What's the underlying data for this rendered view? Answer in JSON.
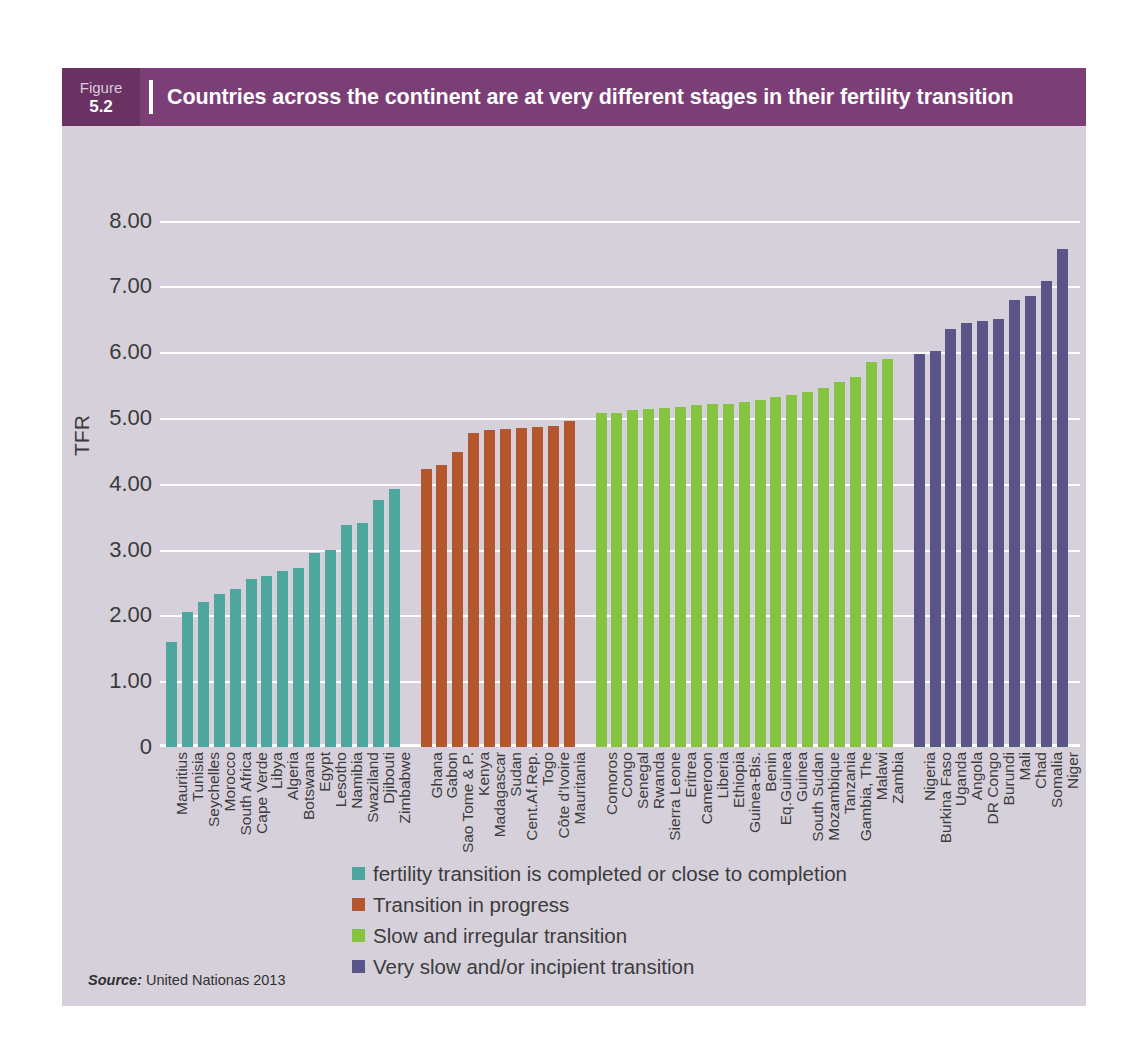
{
  "figure": {
    "tag_word": "Figure",
    "tag_number": "5.2",
    "title": "Countries across the continent are at very different stages in their fertility transition",
    "source_label": "Source:",
    "source_text": "United Nationas 2013"
  },
  "colors": {
    "title_bar": "#7c3e77",
    "title_tag": "#693263",
    "panel": "#d5d0da",
    "gridline": "#ffffff",
    "teal": "#4da79f",
    "orange": "#b4572f",
    "green": "#85c341",
    "purple": "#5a5588"
  },
  "legend": {
    "items": [
      {
        "color": "#4da79f",
        "label": "fertility transition is completed or close to completion"
      },
      {
        "color": "#b4572f",
        "label": "Transition in progress"
      },
      {
        "color": "#85c341",
        "label": "Slow and irregular transition"
      },
      {
        "color": "#5a5588",
        "label": "Very slow and/or incipient transition"
      }
    ]
  },
  "chart_data": {
    "type": "bar",
    "title": "Countries across the continent are at very different stages in their fertility transition",
    "xlabel": "",
    "ylabel": "TFR",
    "ylim": [
      0,
      8
    ],
    "yticks": [
      "0",
      "1.00",
      "2.00",
      "3.00",
      "4.00",
      "5.00",
      "6.00",
      "7.00",
      "8.00"
    ],
    "ytick_values": [
      0,
      1,
      2,
      3,
      4,
      5,
      6,
      7,
      8
    ],
    "grid": true,
    "legend_position": "bottom",
    "groups": [
      {
        "name": "fertility transition is completed or close to completion",
        "color": "#4da79f",
        "categories": [
          "Mauritius",
          "Tunisia",
          "Seychelles",
          "Morocco",
          "South Africa",
          "Cape Verde",
          "Libya",
          "Algeria",
          "Botswana",
          "Egypt",
          "Lesotho",
          "Namibia",
          "Swaziland",
          "Djibouti",
          "Zimbabwe"
        ],
        "values": [
          1.6,
          2.05,
          2.2,
          2.33,
          2.4,
          2.55,
          2.6,
          2.68,
          2.72,
          2.95,
          2.99,
          3.38,
          3.4,
          3.75,
          3.92
        ]
      },
      {
        "name": "Transition in progress",
        "color": "#b4572f",
        "categories": [
          "Ghana",
          "Gabon",
          "Sao Tome & P.",
          "Kenya",
          "Madagascar",
          "Sudan",
          "Cent.Af.Rep.",
          "Togo",
          "Côte d'Ivoire",
          "Mauritania"
        ],
        "values": [
          4.22,
          4.28,
          4.48,
          4.77,
          4.82,
          4.83,
          4.85,
          4.87,
          4.88,
          4.95
        ]
      },
      {
        "name": "Slow and irregular transition",
        "color": "#85c341",
        "categories": [
          "Comoros",
          "Congo",
          "Senegal",
          "Rwanda",
          "Sierra Leone",
          "Eritrea",
          "Cameroon",
          "Liberia",
          "Ethiopia",
          "Guinea-Bis.",
          "Benin",
          "Eq.Guinea",
          "Guinea",
          "South Sudan",
          "Mozambique",
          "Tanzania",
          "Gambia, The",
          "Malawi",
          "Zambia"
        ],
        "values": [
          5.07,
          5.08,
          5.12,
          5.13,
          5.15,
          5.17,
          5.2,
          5.21,
          5.22,
          5.24,
          5.28,
          5.32,
          5.35,
          5.4,
          5.45,
          5.55,
          5.62,
          5.85,
          5.9
        ]
      },
      {
        "name": "Very slow and/or incipient transition",
        "color": "#5a5588",
        "categories": [
          "Nigeria",
          "Burkina Faso",
          "Uganda",
          "Angola",
          "DR Congo",
          "Burundi",
          "Mali",
          "Chad",
          "Somalia",
          "Niger"
        ],
        "values": [
          5.98,
          6.02,
          6.35,
          6.45,
          6.48,
          6.5,
          6.8,
          6.85,
          7.08,
          7.57
        ]
      }
    ]
  }
}
